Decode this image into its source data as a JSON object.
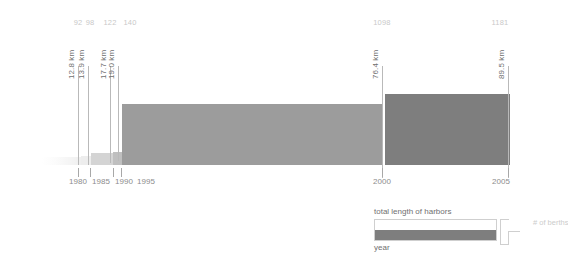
{
  "chart_data": {
    "type": "bar",
    "title": "",
    "subtitle": "",
    "xlabel": "year",
    "ylabel": "total length of harbors",
    "series_secondary_label": "# of berths",
    "categories": [
      "1980",
      "1985",
      "1990",
      "1995",
      "2000",
      "2005"
    ],
    "x_tick_labels": [
      "1980",
      "1985",
      "1990",
      "1995",
      "2000",
      "2005"
    ],
    "length_values_km": [
      12.8,
      13.9,
      17.7,
      19.0,
      76.4,
      89.5
    ],
    "length_value_labels": [
      "12.8 km",
      "13.9 km",
      "17.7 km",
      "19.0 km",
      "76.4 km",
      "89.5 km"
    ],
    "berth_counts": [
      92,
      98,
      122,
      140,
      1098,
      1181
    ],
    "berth_count_labels": [
      "92",
      "98",
      "122",
      "140",
      "1098",
      "1181"
    ],
    "encoding_note": "bar width encodes # of berths, bar height encodes total length of harbors",
    "grid": false,
    "legend_position": "bottom-right",
    "colors": {
      "bar_light": "#ececec",
      "bar_mid": "#cfcfcf",
      "bar_dark_mid": "#bdbdbd",
      "bar_gray": "#9b9b9b",
      "bar_dark": "#7d7d7d",
      "leader_line": "#b9b9b9",
      "berth_text": "#c9c9c9",
      "km_text": "#6f6f6f",
      "year_text": "#8d8d8d",
      "legend_text": "#6f6f6f",
      "background": "#ffffff"
    }
  },
  "bars": [
    {
      "name": "1980",
      "berths": "92",
      "km": "12.8 km",
      "x": 42,
      "w": 39,
      "h": 8,
      "color": "#f2f2f2",
      "fade": true
    },
    {
      "name": "1985",
      "berths": "98",
      "km": "13.9 km",
      "x": 81,
      "w": 10,
      "h": 9,
      "color": "#ededed",
      "fade": false
    },
    {
      "name": "1990",
      "berths": "122",
      "km": "17.7 km",
      "x": 91,
      "w": 22,
      "h": 12,
      "color": "#d4d4d4",
      "fade": false
    },
    {
      "name": "1995",
      "berths": "140",
      "km": "19.0 km",
      "x": 113,
      "w": 9,
      "h": 13,
      "color": "#bfbfbf",
      "fade": false
    },
    {
      "name": "2000",
      "berths": "1098",
      "km": "76.4 km",
      "x": 122,
      "w": 260,
      "h": 61,
      "color": "#9c9c9c",
      "fade": false
    },
    {
      "name": "2005",
      "berths": "1181",
      "km": "89.5 km",
      "x": 385,
      "w": 125,
      "h": 71,
      "color": "#7e7e7e",
      "fade": false
    }
  ],
  "leaders": [
    {
      "name": "leader-1980",
      "x": 78,
      "top": 66,
      "bottom": 165
    },
    {
      "name": "leader-1985",
      "x": 88,
      "top": 66,
      "bottom": 165
    },
    {
      "name": "leader-1990",
      "x": 110,
      "top": 66,
      "bottom": 163
    },
    {
      "name": "leader-1995",
      "x": 118,
      "top": 66,
      "bottom": 161
    },
    {
      "name": "leader-2000",
      "x": 382,
      "top": 66,
      "bottom": 178
    },
    {
      "name": "leader-2005",
      "x": 508,
      "top": 66,
      "bottom": 178
    }
  ],
  "berth_labels": [
    {
      "name": "berth-count-1980",
      "text": "92",
      "cx": 78
    },
    {
      "name": "berth-count-1985",
      "text": "98",
      "cx": 90
    },
    {
      "name": "berth-count-1990",
      "text": "122",
      "cx": 110
    },
    {
      "name": "berth-count-1995",
      "text": "140",
      "cx": 130
    },
    {
      "name": "berth-count-2000",
      "text": "1098",
      "cx": 382
    },
    {
      "name": "berth-count-2005",
      "text": "1181",
      "cx": 500
    }
  ],
  "km_labels": [
    {
      "name": "km-label-1980",
      "text": "12.8 km",
      "x": 76,
      "y": 70
    },
    {
      "name": "km-label-1985",
      "text": "13.9 km",
      "x": 86,
      "y": 70
    },
    {
      "name": "km-label-1990",
      "text": "17.7 km",
      "x": 108,
      "y": 70
    },
    {
      "name": "km-label-1995",
      "text": "19.0 km",
      "x": 116,
      "y": 70
    },
    {
      "name": "km-label-2000",
      "text": "76.4 km",
      "x": 380,
      "y": 70
    },
    {
      "name": "km-label-2005",
      "text": "89.5 km",
      "x": 506,
      "y": 70
    }
  ],
  "year_axis": {
    "ticks": [
      {
        "name": "tick-1980",
        "x": 78,
        "label": "1980",
        "label_cx": 78
      },
      {
        "name": "tick-1985",
        "x": 90,
        "label": "1985",
        "label_cx": 101
      },
      {
        "name": "tick-1990",
        "x": 113,
        "label": "1990",
        "label_cx": 124
      },
      {
        "name": "tick-1995",
        "x": 121,
        "label": "1995",
        "label_cx": 146
      },
      {
        "name": "tick-2000",
        "x": 382,
        "label": "2000",
        "label_cx": 382
      },
      {
        "name": "tick-2005",
        "x": 508,
        "label": "2005",
        "label_cx": 501
      }
    ]
  },
  "legend": {
    "title": "total length of harbors",
    "year_label": "year",
    "berths_label": "# of berths",
    "swatch_color": "#7e7e7e"
  }
}
